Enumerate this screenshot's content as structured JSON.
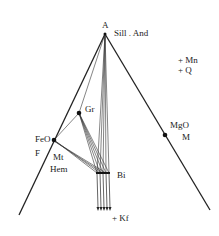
{
  "diagram": {
    "type": "AFM projection phase diagram",
    "apex_label": "A",
    "apex_phase": "Sill . And",
    "left_vertex_labels": [
      "FeO",
      "F"
    ],
    "right_vertex_labels": [
      "MgO",
      "M"
    ],
    "phases": {
      "garnet": "Gr",
      "magnetite": "Mt",
      "hematite": "Hem",
      "biotite": "Bi",
      "kfeldspar": "+ Kf"
    },
    "excess_phases": [
      "+ Mn",
      "+ Q"
    ],
    "colors": {
      "line": "#222222",
      "background": "#ffffff"
    }
  }
}
